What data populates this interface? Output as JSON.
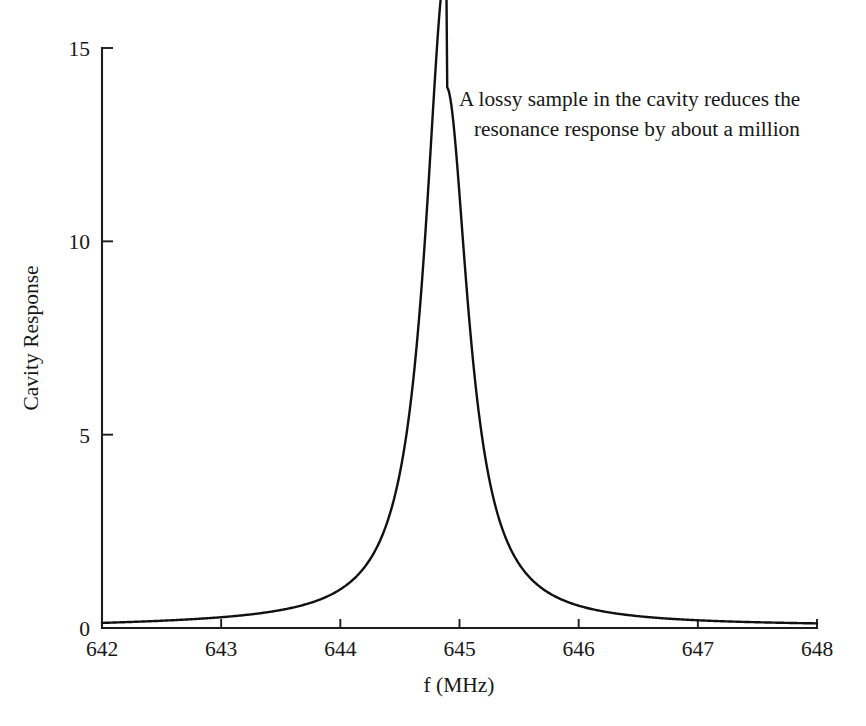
{
  "chart_data": {
    "type": "line",
    "title": "",
    "xlabel": "f (MHz)",
    "ylabel": "Cavity Response",
    "xlim": [
      642,
      648
    ],
    "ylim": [
      0,
      15
    ],
    "xticks": [
      642,
      643,
      644,
      645,
      646,
      647,
      648
    ],
    "yticks": [
      0,
      5,
      10,
      15
    ],
    "grid": false,
    "legend": null,
    "line_color": "#111111",
    "series": [
      {
        "name": "Cavity Response",
        "shape": "lorentzian",
        "peak_x": 644.89,
        "peak_y": 14.0,
        "fwhm": 0.44,
        "baseline": 0.05,
        "x": [
          642.0,
          642.25,
          642.5,
          642.75,
          643.0,
          643.25,
          643.5,
          643.75,
          644.0,
          644.15,
          644.3,
          644.4,
          644.5,
          644.6,
          644.7,
          644.8,
          644.89,
          645.0,
          645.1,
          645.2,
          645.3,
          645.4,
          645.5,
          645.65,
          645.8,
          646.0,
          646.25,
          646.5,
          646.75,
          647.0,
          647.25,
          647.5,
          647.75,
          648.0
        ],
        "y": [
          0.11,
          0.15,
          0.2,
          0.27,
          0.37,
          0.51,
          0.72,
          1.05,
          1.63,
          2.18,
          3.15,
          4.13,
          5.85,
          8.55,
          11.6,
          13.6,
          14.0,
          12.9,
          10.6,
          8.0,
          5.85,
          4.3,
          3.3,
          2.3,
          1.72,
          1.21,
          0.82,
          0.59,
          0.45,
          0.35,
          0.28,
          0.22,
          0.18,
          0.15
        ]
      }
    ],
    "annotations": [
      {
        "id": "lossy-sample-note",
        "line1": "A lossy sample in the cavity reduces the",
        "line2": "resonance response by about a million",
        "target_x": 644.89,
        "target_y": 14.0
      }
    ]
  }
}
